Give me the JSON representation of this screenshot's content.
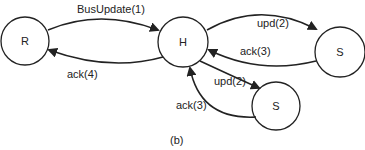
{
  "nodes": [
    {
      "id": "R",
      "label": "R"
    },
    {
      "id": "H",
      "label": "H"
    },
    {
      "id": "S1",
      "label": "S"
    },
    {
      "id": "S2",
      "label": "S"
    }
  ],
  "edges": [
    {
      "from": "R",
      "to": "H",
      "label": "BusUpdate(1)"
    },
    {
      "from": "H",
      "to": "R",
      "label": "ack(4)"
    },
    {
      "from": "H",
      "to": "S1",
      "label": "upd(2)"
    },
    {
      "from": "S1",
      "to": "H",
      "label": "ack(3)"
    },
    {
      "from": "H",
      "to": "S2",
      "label": "upd(2)"
    },
    {
      "from": "S2",
      "to": "H",
      "label": "ack(3)"
    }
  ],
  "caption": "(b)",
  "colors": {
    "stroke": "#222222",
    "background": "#ffffff"
  }
}
